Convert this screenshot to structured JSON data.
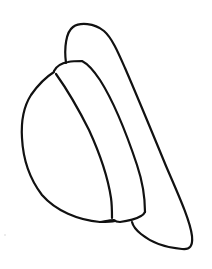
{
  "drawing": {
    "subject": "hat",
    "style": "line-art",
    "stroke_color": "#111111",
    "background_color": "#ffffff",
    "stroke_width": 2.2,
    "parts": [
      {
        "name": "brim",
        "label": "Brim outline"
      },
      {
        "name": "crown-outer",
        "label": "Crown outer curve"
      },
      {
        "name": "band-top",
        "label": "Hat band upper edge"
      },
      {
        "name": "band-inner",
        "label": "Hat band inner edge"
      },
      {
        "name": "band-bottom",
        "label": "Hat band bottom"
      }
    ]
  }
}
